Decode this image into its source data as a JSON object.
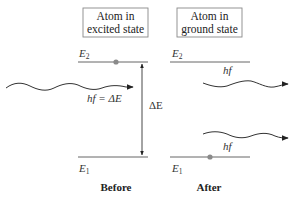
{
  "before": {
    "box_title_line1": "Atom in",
    "box_title_line2": "excited state",
    "upper_level": "E",
    "upper_level_sub": "2",
    "lower_level": "E",
    "lower_level_sub": "1",
    "incoming_photon_label": "hf = ΔE",
    "energy_gap_label": "ΔE",
    "caption": "Before"
  },
  "after": {
    "box_title_line1": "Atom in",
    "box_title_line2": "ground state",
    "upper_level": "E",
    "upper_level_sub": "2",
    "lower_level": "E",
    "lower_level_sub": "1",
    "outgoing_photon_1_label": "hf",
    "outgoing_photon_2_label": "hf",
    "caption": "After"
  },
  "colors": {
    "line": "#555555",
    "electron": "#8a8a8a",
    "box_border": "#888888",
    "text": "#222222"
  }
}
